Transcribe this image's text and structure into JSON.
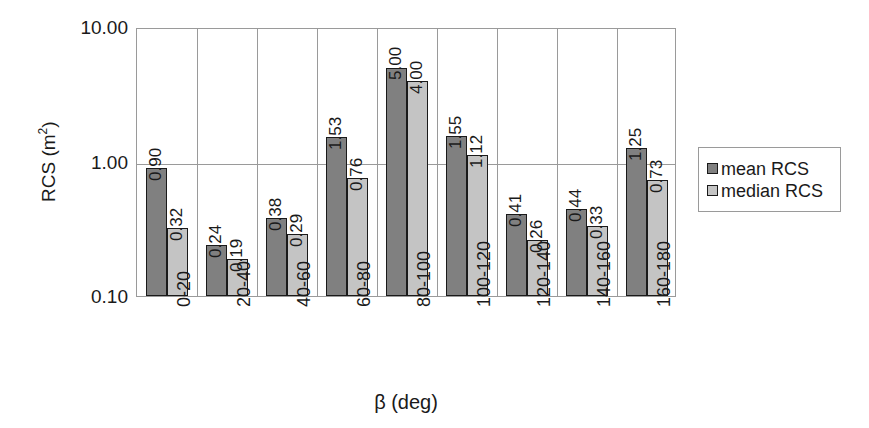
{
  "chart_data": {
    "type": "bar",
    "title": "",
    "xlabel": "β (deg)",
    "ylabel": "RCS (m²)",
    "yscale": "log",
    "ylim": [
      0.1,
      10.0
    ],
    "ytick_labels": [
      "10.00",
      "1.00",
      "0.10"
    ],
    "ytick_values": [
      10.0,
      1.0,
      0.1
    ],
    "grid": true,
    "legend_position": "right",
    "categories": [
      "0-20",
      "20-40",
      "40-60",
      "60-80",
      "80-100",
      "100-120",
      "120-140",
      "140-160",
      "160-180"
    ],
    "series": [
      {
        "name": "mean RCS",
        "color": "#808080",
        "values": [
          0.9,
          0.24,
          0.38,
          1.53,
          5.0,
          1.55,
          0.41,
          0.44,
          1.25
        ],
        "labels": [
          "0.90",
          "0.24",
          "0.38",
          "1.53",
          "5.00",
          "1.55",
          "0.41",
          "0.44",
          "1.25"
        ]
      },
      {
        "name": "median RCS",
        "color": "#c4c4c4",
        "values": [
          0.32,
          0.19,
          0.29,
          0.76,
          4.0,
          1.12,
          0.26,
          0.33,
          0.73
        ],
        "labels": [
          "0.32",
          "0.19",
          "0.29",
          "0.76",
          "4.00",
          "1.12",
          "0.26",
          "0.33",
          "0.73"
        ]
      }
    ]
  },
  "legend": {
    "items": [
      {
        "label": "mean RCS"
      },
      {
        "label": "median RCS"
      }
    ]
  },
  "axes": {
    "y_title_main": "RCS (m",
    "y_title_sup": "2",
    "y_title_close": ")",
    "x_title": "β (deg)"
  }
}
